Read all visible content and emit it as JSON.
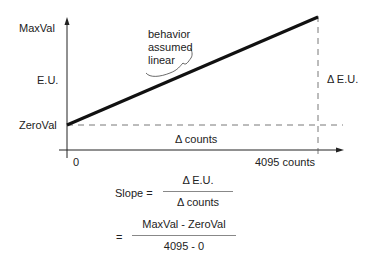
{
  "diagram": {
    "y_labels": {
      "max": "MaxVal",
      "eu": "E.U.",
      "zero": "ZeroVal"
    },
    "x_labels": {
      "origin": "0",
      "end": "4095 counts"
    },
    "annotation": [
      "behavior",
      "assumed",
      "linear"
    ],
    "delta_eu": "Δ E.U.",
    "delta_counts": "Δ counts",
    "colors": {
      "line": "#111111",
      "axis": "#222222",
      "dash": "#555555"
    }
  },
  "formula": {
    "slope_label": "Slope =",
    "line1": {
      "numerator": "Δ E.U.",
      "denominator": "Δ counts"
    },
    "eq": "=",
    "line2": {
      "numerator": "MaxVal - ZeroVal",
      "denominator": "4095 - 0"
    }
  }
}
